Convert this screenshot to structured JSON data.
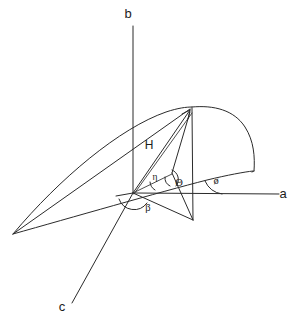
{
  "figure": {
    "background_color": "#ffffff",
    "ink_color": "#2b2b2b",
    "width": 300,
    "height": 324
  },
  "axes": [
    {
      "id": "a",
      "label": "a",
      "label_x": 283,
      "label_y": 198,
      "direction": "horizontal-right"
    },
    {
      "id": "b",
      "label": "b",
      "label_x": 128,
      "label_y": 18,
      "direction": "vertical-up"
    },
    {
      "id": "c",
      "label": "c",
      "label_x": 62,
      "label_y": 311,
      "direction": "oblique-lower-left"
    }
  ],
  "vectors": [
    {
      "id": "H",
      "label": "H",
      "label_x": 149,
      "label_y": 149,
      "description": "resultant vector from origin to apex with arrowhead"
    }
  ],
  "angles": [
    {
      "id": "beta",
      "label": "β",
      "label_x": 148,
      "label_y": 211,
      "description": "angle between c-axis and a-axis in base plane"
    },
    {
      "id": "eta",
      "label": "η",
      "label_x": 155,
      "label_y": 180,
      "description": "angle between H and its projection"
    },
    {
      "id": "theta",
      "label": "Θ",
      "label_x": 177,
      "label_y": 185,
      "description": "angle at projection line"
    },
    {
      "id": "phi",
      "label": "ø",
      "label_x": 215,
      "label_y": 183,
      "description": "angle between a-axis and surface edge"
    }
  ],
  "surface": {
    "name": "curved shell surface",
    "description": "ruled curved surface spanning from lower-left vertex up over the apex and folding down to the right"
  }
}
